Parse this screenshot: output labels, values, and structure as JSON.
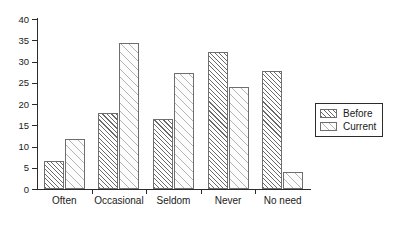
{
  "chart_data": {
    "type": "bar",
    "title": "",
    "subtitle": "",
    "xlabel": "",
    "ylabel": "",
    "categories": [
      "Often",
      "Occasional",
      "Seldom",
      "Never",
      "No need"
    ],
    "series": [
      {
        "name": "Before",
        "values": [
          6.5,
          17.8,
          16.4,
          32.3,
          27.7
        ]
      },
      {
        "name": "Current",
        "values": [
          11.7,
          34.3,
          27.2,
          23.9,
          4.0
        ]
      }
    ],
    "ylim": [
      0,
      40
    ],
    "ytick_labels": [
      "0",
      "5",
      "10",
      "15",
      "20",
      "25",
      "30",
      "35",
      "40"
    ],
    "ytick_values": [
      0,
      5,
      10,
      15,
      20,
      25,
      30,
      35,
      40
    ],
    "grid": false,
    "legend_position": "right-outside",
    "legend_entries": [
      "Before",
      "Current"
    ],
    "colors": {
      "axis": "#2b2b2b",
      "before_hatch": "#6a6a6a",
      "current_hatch": "#b4b4b4",
      "bar_outline": "#6e6e6e",
      "background": "#ffffff",
      "text": "#1a1a1a"
    }
  }
}
